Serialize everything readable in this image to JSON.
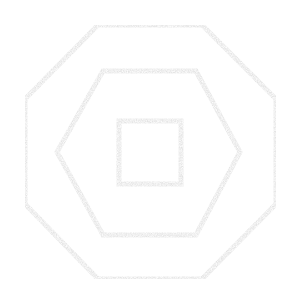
{
  "canvas": {
    "width": 301,
    "height": 307,
    "background": "#ffffff"
  },
  "style": {
    "stroke_color": "#e3e3e3",
    "stroke_width": 5,
    "texture": "speckled"
  },
  "shapes": [
    {
      "name": "outer-octagon",
      "type": "octagon",
      "points": "98,25 202,25 276,99 276,204 202,279 98,279 25,204 25,99"
    },
    {
      "name": "middle-hexagon",
      "type": "hexagon",
      "points": "103,71 196,71 240,152 196,235 103,235 57,152"
    },
    {
      "name": "inner-square",
      "type": "square",
      "points": "119,121 181,121 181,184 119,184"
    }
  ]
}
